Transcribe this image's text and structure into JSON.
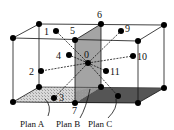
{
  "diagram": {
    "type": "3d-lattice-cube-with-planes",
    "node_labels": {
      "n0": "0",
      "n1": "1",
      "n2": "2",
      "n3": "3",
      "n4": "4",
      "n5": "5",
      "n6": "6",
      "n7": "7",
      "n8": "8",
      "n9": "9",
      "n10": "10",
      "n11": "11"
    },
    "planes": [
      {
        "id": "A",
        "label": "Plan A",
        "fill": "#d6d6d6"
      },
      {
        "id": "B",
        "label": "Plan B",
        "fill": "#9a9a9a"
      },
      {
        "id": "C",
        "label": "Plan C",
        "fill": "#5c5c5c"
      }
    ],
    "colors": {
      "edge": "#111111",
      "node": "#000000",
      "background": "#ffffff"
    }
  }
}
